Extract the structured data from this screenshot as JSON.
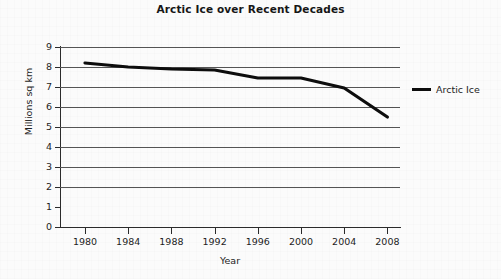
{
  "chart_data": {
    "type": "line",
    "title": "Arctic Ice over Recent Decades",
    "xlabel": "Year",
    "ylabel": "Millions sq km",
    "xlim": [
      1979,
      2010
    ],
    "ylim": [
      0,
      9
    ],
    "grid": true,
    "legend_position": "right",
    "xticks": [
      "1980",
      "1984",
      "1988",
      "1992",
      "1996",
      "2000",
      "2004",
      "2008"
    ],
    "yticks": [
      "0",
      "1",
      "2",
      "3",
      "4",
      "5",
      "6",
      "7",
      "8",
      "9"
    ],
    "x": [
      1980,
      1984,
      1988,
      1992,
      1996,
      2000,
      2004,
      2008
    ],
    "series": [
      {
        "name": "Arctic Ice",
        "color": "#0d0d0d",
        "values": [
          8.2,
          8.0,
          7.9,
          7.85,
          7.45,
          7.45,
          6.95,
          5.5
        ]
      }
    ]
  },
  "legend": {
    "entries": [
      {
        "label": "Arctic Ice",
        "swatch": "line-swatch"
      }
    ]
  }
}
